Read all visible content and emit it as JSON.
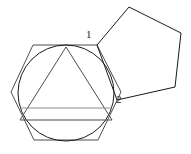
{
  "figure": {
    "background_color": "#ffffff",
    "stroke_color_dark": "#1a1a1a",
    "stroke_color_mid": "#4d4d4d",
    "stroke_color_light": "#8c8c8c",
    "stroke_width": 1,
    "labels": [
      {
        "id": "label-1",
        "text": "1",
        "x": 86,
        "y": 29,
        "describes": "shared-vertex-top"
      },
      {
        "id": "label-2",
        "text": "2",
        "x": 116,
        "y": 94,
        "describes": "shared-vertex-bottom"
      }
    ],
    "shapes": {
      "hexagon": {
        "name": "hexagon",
        "sides": 6,
        "stroke": "#4d4d4d",
        "points": "33,45 97,45 121,92 98,140 34,140 11,92"
      },
      "circle": {
        "name": "inscribed-circle",
        "cx": 66,
        "cy": 93,
        "r": 48,
        "stroke": "#1a1a1a"
      },
      "triangle": {
        "name": "inscribed-triangle",
        "sides": 3,
        "stroke": "#4d4d4d",
        "points": "66,47 112,120 20,120"
      },
      "triangle_base_line": {
        "name": "triangle-base-chord",
        "stroke": "#8c8c8c",
        "x1": 20,
        "y1": 108,
        "x2": 112,
        "y2": 108
      },
      "pentagon": {
        "name": "pentagon",
        "sides": 5,
        "stroke": "#1a1a1a",
        "points": "97,45 129,7 181,33 175,87 117,100"
      }
    }
  }
}
